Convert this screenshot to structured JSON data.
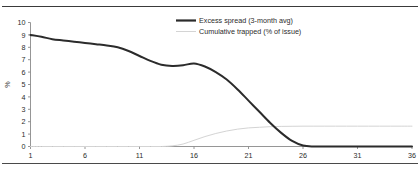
{
  "chart_data": {
    "type": "line",
    "title": "",
    "xlabel": "",
    "ylabel": "%",
    "xlim": [
      1,
      36
    ],
    "ylim": [
      0,
      10
    ],
    "xticks": [
      1,
      6,
      11,
      16,
      21,
      26,
      31,
      36
    ],
    "yticks": [
      0,
      1,
      2,
      3,
      4,
      5,
      6,
      7,
      8,
      9,
      10
    ],
    "grid": false,
    "legend_position": "top-center-right",
    "series": [
      {
        "name": "Excess spread (3-month avg)",
        "color": "#2b2b2b",
        "x": [
          1,
          2,
          3,
          4,
          5,
          6,
          7,
          8,
          9,
          10,
          11,
          12,
          13,
          14,
          15,
          16,
          17,
          18,
          19,
          20,
          21,
          22,
          23,
          24,
          25,
          26,
          27,
          28,
          29,
          30,
          31,
          32,
          33,
          34,
          35,
          36
        ],
        "values": [
          9.0,
          8.85,
          8.65,
          8.55,
          8.45,
          8.35,
          8.25,
          8.15,
          8.0,
          7.7,
          7.3,
          6.9,
          6.6,
          6.5,
          6.55,
          6.7,
          6.45,
          6.0,
          5.4,
          4.6,
          3.7,
          2.8,
          1.9,
          1.1,
          0.45,
          0.08,
          0.0,
          0.0,
          0.0,
          0.0,
          0.0,
          0.0,
          0.0,
          0.0,
          0.0,
          0.0
        ]
      },
      {
        "name": "Cumulative trapped (% of issue)",
        "color": "#d4d4d4",
        "x": [
          1,
          2,
          3,
          4,
          5,
          6,
          7,
          8,
          9,
          10,
          11,
          12,
          13,
          14,
          15,
          16,
          17,
          18,
          19,
          20,
          21,
          22,
          23,
          24,
          25,
          26,
          27,
          28,
          29,
          30,
          31,
          32,
          33,
          34,
          35,
          36
        ],
        "values": [
          0.0,
          0.0,
          0.0,
          0.0,
          0.0,
          0.0,
          0.0,
          0.0,
          0.0,
          0.0,
          0.0,
          0.0,
          0.0,
          0.05,
          0.2,
          0.5,
          0.8,
          1.05,
          1.25,
          1.4,
          1.5,
          1.55,
          1.6,
          1.62,
          1.63,
          1.64,
          1.64,
          1.64,
          1.64,
          1.64,
          1.64,
          1.64,
          1.64,
          1.64,
          1.64,
          1.64
        ]
      }
    ]
  },
  "legend": {
    "entries": [
      {
        "label": "Excess spread (3-month avg)",
        "color": "#2b2b2b",
        "style": "thick-line"
      },
      {
        "label": "Cumulative trapped (% of issue)",
        "color": "#d4d4d4",
        "style": "thin-line"
      }
    ]
  },
  "axes": {
    "y_title": "%",
    "y_tick_labels": [
      "10",
      "9",
      "8",
      "7",
      "6",
      "5",
      "4",
      "3",
      "2",
      "1",
      "0"
    ],
    "x_tick_labels": [
      "1",
      "6",
      "11",
      "16",
      "21",
      "26",
      "31",
      "36"
    ]
  }
}
